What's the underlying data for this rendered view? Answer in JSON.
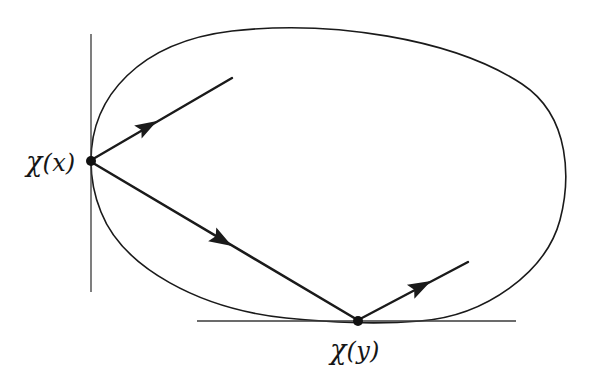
{
  "figure": {
    "background_color": "#ffffff",
    "stroke_color": "#1a1a1a",
    "labels": [
      {
        "id": "chi-x",
        "text": "χ(x)",
        "chi": "χ",
        "arg": "(x)",
        "x": 26,
        "y": 146,
        "anchor_point": "chi-x-point"
      },
      {
        "id": "chi-y",
        "text": "χ(y)",
        "chi": "χ",
        "arg": "(y)",
        "x": 330,
        "y": 334,
        "anchor_point": "chi-y-point"
      }
    ],
    "points": [
      {
        "id": "chi-x-point",
        "label": "χ(x)",
        "x": 91,
        "y": 161,
        "radius": 5
      },
      {
        "id": "chi-y-point",
        "label": "χ(y)",
        "x": 358,
        "y": 321,
        "radius": 5
      }
    ],
    "tangent_lines": [
      {
        "id": "vertical-tangent",
        "orientation": "vertical",
        "at_point": "chi-x-point",
        "x1": 91,
        "y1": 34,
        "x2": 91,
        "y2": 292,
        "stroke_width": 1.3
      },
      {
        "id": "horizontal-tangent",
        "orientation": "horizontal",
        "at_point": "chi-y-point",
        "x1": 197,
        "y1": 321,
        "x2": 516,
        "y2": 321,
        "stroke_width": 1.3
      }
    ],
    "closed_curve": {
      "id": "convex-loop",
      "stroke_width": 1.6,
      "fill": "none",
      "path": "M 91 161 C 91 96 140 42 232 31 C 330 20 452 38 522 84 C 572 117 570 182 560 220 C 546 272 486 316 420 321 C 372 325 330 322 286 318 C 200 309 123 268 101 212 C 94 195 91 178 91 161 Z"
    },
    "vectors": [
      {
        "id": "incoming-vector-at-x",
        "description": "arrow pointing toward chi(x) from upper right",
        "from_x": 232,
        "from_y": 78,
        "to_x": 93,
        "to_y": 159,
        "arrowhead_at": "middle",
        "arrowhead_x": 157,
        "arrowhead_y": 121,
        "stroke_width": 2.4
      },
      {
        "id": "transport-vector-x-to-y",
        "description": "arrow from chi(x) to chi(y)",
        "from_x": 93,
        "from_y": 163,
        "to_x": 356,
        "to_y": 319,
        "arrowhead_at": "middle",
        "arrowhead_x": 222,
        "arrowhead_y": 240,
        "stroke_width": 2.6
      },
      {
        "id": "outgoing-vector-at-y",
        "description": "arrow leaving chi(y) toward upper right",
        "from_x": 360,
        "from_y": 319,
        "to_x": 468,
        "to_y": 262,
        "arrowhead_at": "middle",
        "arrowhead_x": 419,
        "arrowhead_y": 288,
        "stroke_width": 2.4
      }
    ]
  }
}
